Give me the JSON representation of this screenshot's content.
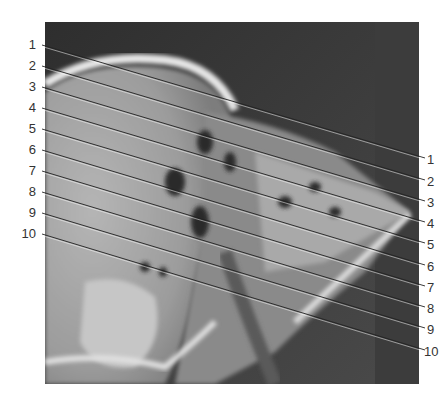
{
  "figure": {
    "type": "CT scan, sagittal section with numbered leader lines",
    "labels_left": [
      "1",
      "2",
      "3",
      "4",
      "5",
      "6",
      "7",
      "8",
      "9",
      "10"
    ],
    "labels_right": [
      "1",
      "2",
      "3",
      "4",
      "5",
      "6",
      "7",
      "8",
      "9",
      "10"
    ]
  }
}
